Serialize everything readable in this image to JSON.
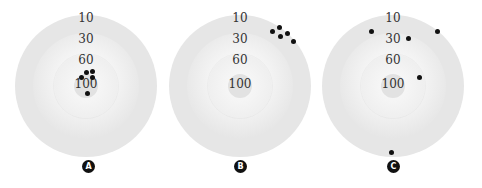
{
  "figure": {
    "ring_labels": [
      "10",
      "30",
      "60",
      "100"
    ],
    "targets": [
      {
        "badge": "A",
        "center": [
          86,
          86
        ],
        "shots": [
          [
            86,
            72
          ],
          [
            92,
            71
          ],
          [
            81,
            77
          ],
          [
            92,
            77
          ],
          [
            87,
            93
          ]
        ]
      },
      {
        "badge": "B",
        "center": [
          240,
          86
        ],
        "shots": [
          [
            272,
            31
          ],
          [
            279,
            27
          ],
          [
            280,
            36
          ],
          [
            287,
            33
          ],
          [
            293,
            41
          ]
        ]
      },
      {
        "badge": "C",
        "center": [
          393,
          86
        ],
        "shots": [
          [
            371,
            31
          ],
          [
            437,
            31
          ],
          [
            408,
            38
          ],
          [
            419,
            77
          ],
          [
            391,
            152
          ]
        ]
      }
    ]
  },
  "colors": {
    "outer_ring": "#e6e6e6",
    "shot": "#111111",
    "badge_bg": "#111111",
    "badge_text": "#ffffff",
    "label_text": "#333333"
  }
}
